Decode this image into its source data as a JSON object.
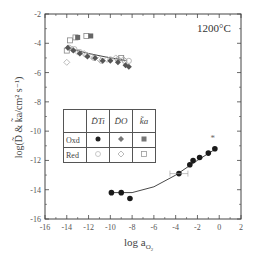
{
  "chart_data": {
    "type": "scatter",
    "title": "",
    "annotation": "1200°C",
    "xlabel": "log a_O2",
    "ylabel": "log(D̃ & k̃a/cm² s⁻¹)",
    "xlim": [
      -16,
      2
    ],
    "ylim": [
      -16,
      -2
    ],
    "xticks": [
      -16,
      -14,
      -12,
      -10,
      -8,
      -6,
      -4,
      -2,
      0,
      2
    ],
    "yticks": [
      -16,
      -14,
      -12,
      -10,
      -8,
      -6,
      -4,
      -2
    ],
    "grid": false,
    "legend": {
      "position": "center-left table",
      "columns": [
        "D̃_Ti",
        "D̃_O",
        "k̃a"
      ],
      "rows": [
        {
          "label": "Oxd",
          "markers": [
            "filled-circle",
            "filled-diamond",
            "filled-square"
          ]
        },
        {
          "label": "Red",
          "markers": [
            "open-circle",
            "open-diamond",
            "open-square"
          ]
        }
      ]
    },
    "series": [
      {
        "name": "D_Ti Red (reduced region)",
        "marker": "open-circle",
        "x": [
          -13.8,
          -13.3,
          -12.8,
          -12.2,
          -11.5,
          -10.8,
          -10.0,
          -9.3,
          -8.7,
          -8.3
        ],
        "y": [
          -4.3,
          -4.4,
          -4.6,
          -4.8,
          -5.0,
          -5.2,
          -5.1,
          -5.1,
          -5.2,
          -5.2
        ]
      },
      {
        "name": "D_O Red",
        "marker": "open-diamond",
        "x": [
          -14.0,
          -13.5,
          -13.0,
          -12.4,
          -11.7,
          -11.0,
          -10.3,
          -9.5,
          -8.8
        ],
        "y": [
          -5.3,
          -4.4,
          -4.6,
          -4.7,
          -4.9,
          -5.1,
          -5.1,
          -5.0,
          -5.1
        ]
      },
      {
        "name": "ka Red",
        "marker": "open-square",
        "x": [
          -14.0,
          -13.7,
          -13.2,
          -12.2,
          -9.0
        ],
        "y": [
          -4.5,
          -3.8,
          -3.6,
          -3.5,
          -5.0
        ]
      },
      {
        "name": "ka Oxd (upper)",
        "marker": "filled-square",
        "x": [
          -13.0,
          -11.8
        ],
        "y": [
          -3.6,
          -3.5
        ]
      },
      {
        "name": "D_Ti Oxd (reduced region)",
        "marker": "filled-diamond",
        "x": [
          -13.9,
          -13.4,
          -12.8,
          -12.1,
          -11.4,
          -10.7,
          -10.0,
          -9.3,
          -8.6,
          -8.3
        ],
        "y": [
          -4.3,
          -4.5,
          -4.7,
          -4.9,
          -5.0,
          -5.2,
          -5.2,
          -5.3,
          -5.5,
          -5.6
        ]
      },
      {
        "name": "D_Ti Oxd (oxidized region)",
        "marker": "filled-circle",
        "x": [
          -9.9,
          -9.0,
          -8.2,
          -3.7,
          -2.7,
          -2.4,
          -1.8,
          -1.0,
          -0.4
        ],
        "y": [
          -14.2,
          -14.2,
          -14.6,
          -12.9,
          -12.3,
          -12.0,
          -11.8,
          -11.5,
          -11.2
        ]
      },
      {
        "name": "outlier",
        "marker": "star",
        "x": [
          -0.6
        ],
        "y": [
          -10.5
        ]
      }
    ],
    "fit_lines": [
      {
        "region": "reduced",
        "x": [
          -14,
          -12,
          -10,
          -9,
          -8.5
        ],
        "y": [
          -4.3,
          -4.7,
          -5.0,
          -5.1,
          -5.2
        ]
      },
      {
        "region": "oxidized",
        "x": [
          -10,
          -8,
          -6,
          -4,
          -2,
          -0.3
        ],
        "y": [
          -14.2,
          -14.2,
          -13.8,
          -13.0,
          -12.0,
          -11.2
        ]
      }
    ]
  },
  "labels": {
    "temperature": "1200°C",
    "xlabel": "log a",
    "xlabel_sub": "O",
    "xlabel_sub2": "2",
    "ylabel": "log(D̃ & k̃a/cm² s⁻¹)",
    "legend_headers": [
      "",
      "D̃Ti",
      "D̃O",
      "k̃a"
    ],
    "legend_row_oxd": "Oxd",
    "legend_row_red": "Red"
  }
}
